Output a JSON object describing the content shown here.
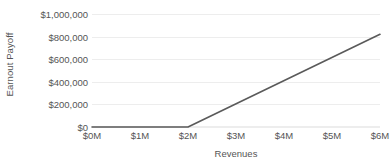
{
  "chart_data": {
    "type": "line",
    "title": "",
    "subtitle": "",
    "xlabel": "Revenues",
    "ylabel": "Earnout Payoff",
    "x": [
      0,
      1000000,
      2000000,
      3000000,
      4000000,
      5000000,
      6000000
    ],
    "series": [
      {
        "name": "Earnout Payoff",
        "color": "#5a5a5a",
        "points": [
          {
            "x": 0,
            "y": 0
          },
          {
            "x": 2000000,
            "y": 0
          },
          {
            "x": 6000000,
            "y": 820000
          }
        ],
        "values": [
          0,
          0,
          0,
          205000,
          410000,
          615000,
          820000
        ]
      }
    ],
    "xlim": [
      0,
      6000000
    ],
    "ylim": [
      0,
      1000000
    ],
    "x_tick_labels": [
      "$0M",
      "$1M",
      "$2M",
      "$3M",
      "$4M",
      "$5M",
      "$6M"
    ],
    "x_tick_values": [
      0,
      1000000,
      2000000,
      3000000,
      4000000,
      5000000,
      6000000
    ],
    "y_tick_labels": [
      "$0",
      "$200,000",
      "$400,000",
      "$600,000",
      "$800,000",
      "$1,000,000"
    ],
    "y_tick_values": [
      0,
      200000,
      400000,
      600000,
      800000,
      1000000
    ],
    "grid": true,
    "grid_color": "#ededed",
    "legend": false,
    "legend_position": "none",
    "annotations": [],
    "background_color": "#ffffff",
    "text_color": "#555555",
    "kink_point": {
      "x": 2000000,
      "y": 0,
      "label": "threshold"
    }
  }
}
